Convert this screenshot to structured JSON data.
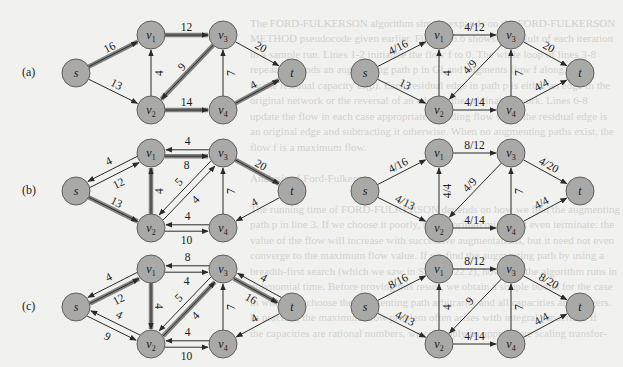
{
  "figure": {
    "rows": [
      {
        "panel_label": "(a)"
      },
      {
        "panel_label": "(b)"
      },
      {
        "panel_label": "(c)"
      }
    ],
    "node_labels": {
      "s": "s",
      "v1": "v1",
      "v2": "v2",
      "v3": "v3",
      "v4": "v4",
      "t": "t"
    },
    "node_color": "#a9a9a7",
    "highlight_color": "#6e6e6c",
    "residual_networks": [
      {
        "row": "(a)",
        "edges": [
          {
            "from": "s",
            "to": "v1",
            "label": "16",
            "augmenting": true
          },
          {
            "from": "s",
            "to": "v2",
            "label": "13",
            "augmenting": false
          },
          {
            "from": "v2",
            "to": "v1",
            "label": "4",
            "augmenting": false
          },
          {
            "from": "v1",
            "to": "v3",
            "label": "12",
            "augmenting": true
          },
          {
            "from": "v3",
            "to": "v2",
            "label": "9",
            "augmenting": true
          },
          {
            "from": "v2",
            "to": "v4",
            "label": "14",
            "augmenting": true
          },
          {
            "from": "v4",
            "to": "v3",
            "label": "7",
            "augmenting": false
          },
          {
            "from": "v3",
            "to": "t",
            "label": "20",
            "augmenting": false
          },
          {
            "from": "v4",
            "to": "t",
            "label": "4",
            "augmenting": true
          }
        ]
      },
      {
        "row": "(b)",
        "edges": [
          {
            "from": "s",
            "to": "v1",
            "label": "12",
            "augmenting": false
          },
          {
            "from": "v1",
            "to": "s",
            "label": "4",
            "augmenting": false
          },
          {
            "from": "s",
            "to": "v2",
            "label": "13",
            "augmenting": true
          },
          {
            "from": "v2",
            "to": "v1",
            "label": "4",
            "augmenting": true
          },
          {
            "from": "v1",
            "to": "v3",
            "label": "8",
            "augmenting": true
          },
          {
            "from": "v3",
            "to": "v1",
            "label": "4",
            "augmenting": false
          },
          {
            "from": "v2",
            "to": "v3",
            "label": "4",
            "augmenting": false
          },
          {
            "from": "v3",
            "to": "v2",
            "label": "5",
            "augmenting": false
          },
          {
            "from": "v2",
            "to": "v4",
            "label": "10",
            "augmenting": false
          },
          {
            "from": "v4",
            "to": "v2",
            "label": "4",
            "augmenting": false
          },
          {
            "from": "v4",
            "to": "v3",
            "label": "7",
            "augmenting": false
          },
          {
            "from": "v3",
            "to": "t",
            "label": "20",
            "augmenting": true
          },
          {
            "from": "t",
            "to": "v4",
            "label": "4",
            "augmenting": false
          }
        ]
      },
      {
        "row": "(c)",
        "edges": [
          {
            "from": "s",
            "to": "v1",
            "label": "12",
            "augmenting": true
          },
          {
            "from": "v1",
            "to": "s",
            "label": "4",
            "augmenting": false
          },
          {
            "from": "s",
            "to": "v2",
            "label": "9",
            "augmenting": false
          },
          {
            "from": "v2",
            "to": "s",
            "label": "4",
            "augmenting": false
          },
          {
            "from": "v1",
            "to": "v2",
            "label": "4",
            "augmenting": true
          },
          {
            "from": "v1",
            "to": "v3",
            "label": "4",
            "augmenting": false
          },
          {
            "from": "v3",
            "to": "v1",
            "label": "8",
            "augmenting": false
          },
          {
            "from": "v2",
            "to": "v3",
            "label": "4",
            "augmenting": true
          },
          {
            "from": "v3",
            "to": "v2",
            "label": "5",
            "augmenting": false
          },
          {
            "from": "v2",
            "to": "v4",
            "label": "10",
            "augmenting": false
          },
          {
            "from": "v4",
            "to": "v2",
            "label": "4",
            "augmenting": false
          },
          {
            "from": "v4",
            "to": "v3",
            "label": "7",
            "augmenting": false
          },
          {
            "from": "v3",
            "to": "t",
            "label": "16",
            "augmenting": true
          },
          {
            "from": "t",
            "to": "v3",
            "label": "4",
            "augmenting": false
          },
          {
            "from": "t",
            "to": "v4",
            "label": "4",
            "augmenting": false
          }
        ]
      }
    ],
    "flow_networks": [
      {
        "row": "(a)",
        "edges": [
          {
            "from": "s",
            "to": "v1",
            "label": "4/16"
          },
          {
            "from": "s",
            "to": "v2",
            "label": "13"
          },
          {
            "from": "v2",
            "to": "v1",
            "label": "4"
          },
          {
            "from": "v1",
            "to": "v3",
            "label": "4/12"
          },
          {
            "from": "v3",
            "to": "v2",
            "label": "4/9"
          },
          {
            "from": "v2",
            "to": "v4",
            "label": "4/14"
          },
          {
            "from": "v4",
            "to": "v3",
            "label": "7"
          },
          {
            "from": "v3",
            "to": "t",
            "label": "20"
          },
          {
            "from": "v4",
            "to": "t",
            "label": "4/4"
          }
        ]
      },
      {
        "row": "(b)",
        "edges": [
          {
            "from": "s",
            "to": "v1",
            "label": "4/16"
          },
          {
            "from": "s",
            "to": "v2",
            "label": "4/13"
          },
          {
            "from": "v2",
            "to": "v1",
            "label": "4/4"
          },
          {
            "from": "v1",
            "to": "v3",
            "label": "8/12"
          },
          {
            "from": "v3",
            "to": "v2",
            "label": "4/9"
          },
          {
            "from": "v2",
            "to": "v4",
            "label": "4/14"
          },
          {
            "from": "v4",
            "to": "v3",
            "label": "7"
          },
          {
            "from": "v3",
            "to": "t",
            "label": "4/20"
          },
          {
            "from": "v4",
            "to": "t",
            "label": "4/4"
          }
        ]
      },
      {
        "row": "(c)",
        "edges": [
          {
            "from": "s",
            "to": "v1",
            "label": "8/16"
          },
          {
            "from": "s",
            "to": "v2",
            "label": "4/13"
          },
          {
            "from": "v2",
            "to": "v1",
            "label": "4"
          },
          {
            "from": "v1",
            "to": "v3",
            "label": "8/12"
          },
          {
            "from": "v3",
            "to": "v2",
            "label": "9"
          },
          {
            "from": "v2",
            "to": "v4",
            "label": "4/14"
          },
          {
            "from": "v4",
            "to": "v3",
            "label": "7"
          },
          {
            "from": "v3",
            "to": "t",
            "label": "8/20"
          },
          {
            "from": "v4",
            "to": "t",
            "label": "4/4"
          }
        ]
      }
    ]
  },
  "background_text": {
    "lines": [
      "",
      "The FORD-FULKERSON algorithm simply expands on the FORD-FULKERSON",
      "METHOD pseudocode given earlier. Figure 26.6 shows the result of each iteration",
      "in a sample run. Lines 1-2 initialize the flow f to 0. The while loop of lines 3-8",
      "repeatedly finds an augmenting path p in Gf and augments flow f along p",
      "by the residual capacity cf(p). Each residual edge in path p is either an edge in the",
      "original network or the reversal of an edge in the original network. Lines 6-8",
      "update the flow in each case appropriately, adding flow when the residual edge is",
      "an original edge and subtracting it otherwise. When no augmenting paths exist, the",
      "flow f is a maximum flow.",
      "",
      "Analysis of Ford-Fulkerson",
      "",
      "The running time of FORD-FULKERSON depends on how we find the augmenting",
      "path p in line 3. If we choose it poorly, the algorithm might not even terminate: the",
      "value of the flow will increase with successive augmentations, but it need not even",
      "converge to the maximum flow value. If we find the augmenting path by using a",
      "breadth-first search (which we saw in Section 22.2), however, the algorithm runs in",
      "polynomial time. Before proving this result, we obtain a simple bound for the case",
      "in which we choose the augmenting path arbitrarily and all capacities are integers.",
      "In practice, the maximum-flow problem often arises with integral capacities. If",
      "the capacities are rational numbers, we can apply an appropriate scaling transfor-"
    ]
  }
}
